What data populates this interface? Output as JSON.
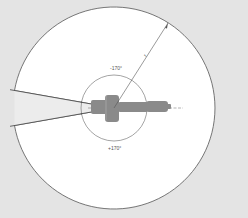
{
  "diagram": {
    "type": "robot-workspace-top-view",
    "center": {
      "x": 114,
      "y": 108
    },
    "outer_radius": 101,
    "inner_radius": 33,
    "gap_half_angle_deg": 10,
    "labels": {
      "radius": "r",
      "rotation_negative": "-170°",
      "rotation_positive": "+170°"
    },
    "colors": {
      "background": "#e4e4e4",
      "workspace_fill": "#ffffff",
      "outline": "#555555",
      "gap_fill": "#ececec",
      "robot_body": "#8a8a8a"
    }
  }
}
